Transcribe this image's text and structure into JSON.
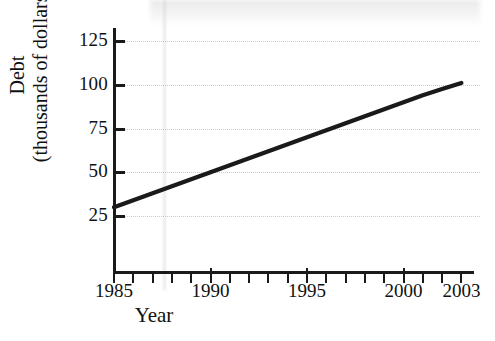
{
  "chart_data": {
    "type": "line",
    "title": "",
    "xlabel": "Year",
    "ylabel": "Debt\n(thousands of dollars)",
    "ylabel_line1": "Debt",
    "ylabel_line2": "(thousands of dollars)",
    "xlim": [
      1985,
      2003.6
    ],
    "ylim": [
      0,
      133
    ],
    "grid": "horizontal-dotted",
    "legend": "none",
    "line_color": "#1a1a1a",
    "grid_color": "#c9c9cf",
    "axis_color": "#1a1a1a",
    "x_tick_labels": [
      "1985",
      "1990",
      "1995",
      "2000",
      "2003"
    ],
    "x_tick_label_values": [
      1985,
      1990,
      1995,
      2000,
      2003
    ],
    "x_minor_ticks": [
      1985,
      1986,
      1987,
      1988,
      1989,
      1990,
      1991,
      1992,
      1993,
      1994,
      1995,
      1996,
      1997,
      1998,
      1999,
      2000,
      2001,
      2002,
      2003
    ],
    "x_major_ticks": [
      1990,
      1995,
      2000
    ],
    "y_tick_labels": [
      "25",
      "50",
      "75",
      "100",
      "125"
    ],
    "y_tick_values": [
      25,
      50,
      75,
      100,
      125
    ],
    "x": [
      1985,
      1986,
      1987,
      1988,
      1989,
      1990,
      1991,
      1992,
      1993,
      1994,
      1995,
      1996,
      1997,
      1998,
      1999,
      2000,
      2001,
      2002,
      2003
    ],
    "values": [
      30,
      34,
      38,
      42,
      46,
      50,
      54,
      58,
      62,
      66,
      70,
      74,
      78,
      82,
      86,
      90,
      94,
      97.5,
      101
    ],
    "series": [
      {
        "name": "Debt",
        "values": [
          30,
          34,
          38,
          42,
          46,
          50,
          54,
          58,
          62,
          66,
          70,
          74,
          78,
          82,
          86,
          90,
          94,
          97.5,
          101
        ]
      }
    ],
    "endpoints": {
      "start": {
        "year": 1985,
        "debt": 30
      },
      "end": {
        "year": 2003,
        "debt": 101
      }
    }
  }
}
